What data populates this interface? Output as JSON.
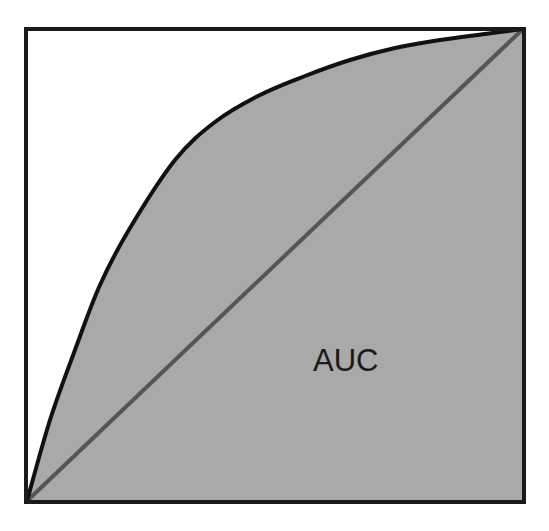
{
  "diagram": {
    "type": "roc_curve_illustration",
    "label": "AUC",
    "colors": {
      "fill": "#a9a9a9",
      "border": "#1a1a1a",
      "curve": "#111111",
      "diagonal": "#555555",
      "background": "#ffffff"
    },
    "box": {
      "x": 26,
      "y": 29,
      "width": 498,
      "height": 473
    },
    "curve_points": [
      [
        27,
        501
      ],
      [
        50,
        420
      ],
      [
        75,
        350
      ],
      [
        100,
        285
      ],
      [
        130,
        228
      ],
      [
        175,
        160
      ],
      [
        215,
        122
      ],
      [
        260,
        95
      ],
      [
        305,
        76
      ],
      [
        350,
        60
      ],
      [
        395,
        48
      ],
      [
        440,
        40
      ],
      [
        485,
        34
      ],
      [
        523,
        29
      ]
    ],
    "diagonal": {
      "from": [
        27,
        501
      ],
      "to": [
        523,
        29
      ]
    }
  }
}
